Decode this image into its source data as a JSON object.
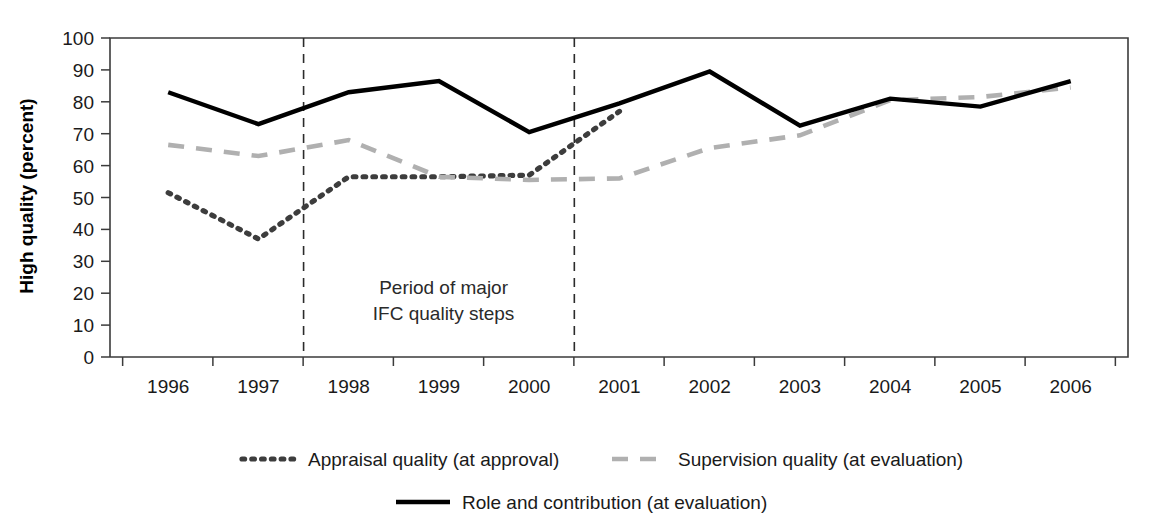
{
  "chart_data": {
    "type": "line",
    "title": "",
    "xlabel": "",
    "ylabel": "High quality (percent)",
    "ylim": [
      0,
      100
    ],
    "yticks": [
      0,
      10,
      20,
      30,
      40,
      50,
      60,
      70,
      80,
      90,
      100
    ],
    "categories": [
      "1996",
      "1997",
      "1998",
      "1999",
      "2000",
      "2001",
      "2002",
      "2003",
      "2004",
      "2005",
      "2006"
    ],
    "grid": false,
    "legend_position": "bottom",
    "series": [
      {
        "name": "Appraisal quality (at approval)",
        "style": "dotted",
        "color": "#3d3d3d",
        "values": [
          51.5,
          37.0,
          56.5,
          56.5,
          57.0,
          77.0,
          null,
          null,
          null,
          null,
          null
        ]
      },
      {
        "name": "Supervision quality (at evaluation)",
        "style": "dashed",
        "color": "#b0b0b0",
        "values": [
          66.5,
          63.0,
          68.0,
          56.5,
          55.5,
          56.0,
          65.5,
          69.5,
          80.5,
          81.5,
          84.5
        ]
      },
      {
        "name": "Role and contribution (at evaluation)",
        "style": "solid",
        "color": "#000000",
        "values": [
          83.0,
          73.0,
          83.0,
          86.5,
          70.5,
          79.5,
          89.5,
          72.5,
          81.0,
          78.5,
          86.5
        ]
      }
    ],
    "annotations": [
      {
        "name": "period-of-major-ifc-quality-steps",
        "lines": [
          "Period of major",
          "IFC quality steps"
        ],
        "x_center": 1997.5
      }
    ],
    "event_lines": [
      {
        "name": "event-line-start",
        "x": 1997.5
      },
      {
        "name": "event-line-end",
        "x": 2000.5
      }
    ]
  }
}
